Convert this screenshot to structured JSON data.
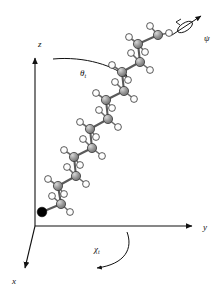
{
  "figure": {
    "background_color": "#ffffff",
    "width": 224,
    "height": 292
  },
  "axes": {
    "origin": {
      "x": 35,
      "y": 226
    },
    "items": [
      {
        "name": "z-axis",
        "label": "z",
        "label_x": 38,
        "label_y": 47,
        "tip_x": 35,
        "tip_y": 54,
        "direction": "up"
      },
      {
        "name": "y-axis",
        "label": "y",
        "label_x": 206,
        "label_y": 232,
        "tip_x": 196,
        "tip_y": 226,
        "direction": "right"
      },
      {
        "name": "x-axis",
        "label": "x",
        "label_x": 13,
        "label_y": 284,
        "tip_x": 24,
        "tip_y": 270,
        "direction": "down-left"
      }
    ],
    "line_color": "#111111"
  },
  "angles": [
    {
      "name": "theta-t",
      "symbol": "θ",
      "subscript": "t",
      "label_x": 83,
      "label_y": 75,
      "description": "bond/chain tilt angle arc above molecule"
    },
    {
      "name": "chi-t",
      "symbol": "χ",
      "subscript": "t",
      "label_x": 97,
      "label_y": 250,
      "description": "azimuthal rotation arc below y-axis"
    },
    {
      "name": "psi",
      "symbol": "ψ",
      "subscript": "",
      "label_x": 205,
      "label_y": 40,
      "description": "rotation about chain end axis"
    }
  ],
  "molecule": {
    "name": "alkane-chain",
    "carbon_color": "#8c8c8c",
    "carbon_highlight": "#cfcfcf",
    "carbon_stroke": "#3a3a3a",
    "hydrogen_color": "#ffffff",
    "hydrogen_stroke": "#333333",
    "terminal_atom_color": "#000000",
    "bond_color": "#555555",
    "carbon_radius": 4.6,
    "hydrogen_radius": 3.4,
    "terminal_radius": 4.6,
    "terminal_atom": {
      "x": 42,
      "y": 212
    },
    "backbone": [
      {
        "x": 61,
        "y": 204
      },
      {
        "x": 58,
        "y": 186
      },
      {
        "x": 76,
        "y": 176
      },
      {
        "x": 74,
        "y": 157
      },
      {
        "x": 92,
        "y": 148
      },
      {
        "x": 90,
        "y": 129
      },
      {
        "x": 108,
        "y": 119
      },
      {
        "x": 106,
        "y": 100
      },
      {
        "x": 124,
        "y": 91
      },
      {
        "x": 122,
        "y": 72
      },
      {
        "x": 140,
        "y": 62
      },
      {
        "x": 138,
        "y": 44
      },
      {
        "x": 158,
        "y": 35
      }
    ],
    "hydrogens": [
      {
        "x": 52,
        "y": 196
      },
      {
        "x": 70,
        "y": 212
      },
      {
        "x": 48,
        "y": 179
      },
      {
        "x": 64,
        "y": 194
      },
      {
        "x": 67,
        "y": 167
      },
      {
        "x": 86,
        "y": 184
      },
      {
        "x": 64,
        "y": 150
      },
      {
        "x": 80,
        "y": 165
      },
      {
        "x": 83,
        "y": 139
      },
      {
        "x": 102,
        "y": 156
      },
      {
        "x": 80,
        "y": 122
      },
      {
        "x": 96,
        "y": 137
      },
      {
        "x": 99,
        "y": 110
      },
      {
        "x": 118,
        "y": 127
      },
      {
        "x": 96,
        "y": 93
      },
      {
        "x": 112,
        "y": 108
      },
      {
        "x": 115,
        "y": 82
      },
      {
        "x": 134,
        "y": 99
      },
      {
        "x": 112,
        "y": 65
      },
      {
        "x": 128,
        "y": 80
      },
      {
        "x": 131,
        "y": 53
      },
      {
        "x": 150,
        "y": 70
      },
      {
        "x": 129,
        "y": 37
      },
      {
        "x": 145,
        "y": 52
      },
      {
        "x": 150,
        "y": 26
      },
      {
        "x": 169,
        "y": 33
      }
    ]
  }
}
